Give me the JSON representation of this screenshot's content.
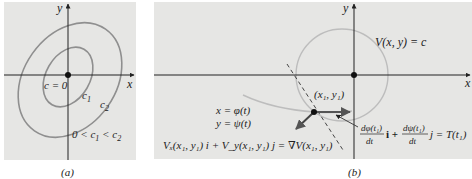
{
  "colors": {
    "panel_bg": "#e6e6e4",
    "axis": "#222222",
    "curve": "#8f8f8f",
    "light_curve": "#bdbdbd",
    "text": "#222222"
  },
  "panel_a": {
    "caption": "(a)",
    "x_axis_label": "x",
    "y_axis_label": "y",
    "origin_label": "c = 0",
    "inner_level_label": "c",
    "inner_level_sub": "1",
    "outer_level_label": "c",
    "outer_level_sub": "2",
    "inequality_0": "0 < c",
    "inequality_sub1": "1",
    "inequality_mid": " < c",
    "inequality_sub2": "2"
  },
  "panel_b": {
    "caption": "(b)",
    "x_axis_label": "x",
    "y_axis_label": "y",
    "level_curve_label": "V(x, y) = c",
    "point_label": "(x₁, y₁)",
    "param_x": "x = φ(t)",
    "param_y": "y = ψ(t)",
    "gradient_eq": "Vₓ(x₁, y₁) i + V_y(x₁, y₁) j = ∇V(x₁, y₁)",
    "tangent_num1": "dφ(t₁)",
    "tangent_den1": "dt",
    "tangent_i": "i +",
    "tangent_num2": "dψ(t₁)",
    "tangent_den2": "dt",
    "tangent_rhs": "j = T(t₁)"
  }
}
